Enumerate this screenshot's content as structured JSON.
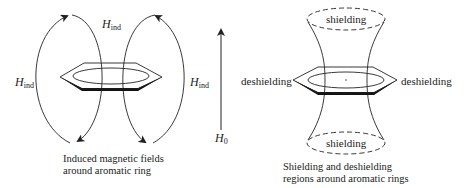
{
  "left_panel": {
    "title_lines": [
      "Induced magnetic fields",
      "around aromatic ring"
    ],
    "field_label": {
      "symbol": "H",
      "subscript": "ind"
    },
    "applied_field_label": {
      "symbol": "H",
      "subscript": "0"
    }
  },
  "right_panel": {
    "title_lines": [
      "Shielding and deshielding",
      "regions around aromatic rings"
    ],
    "top_region": "shielding",
    "bottom_region": "shielding",
    "left_region": "deshielding",
    "right_region": "deshielding"
  },
  "colors": {
    "stroke": "#222222",
    "background": "#ffffff"
  }
}
